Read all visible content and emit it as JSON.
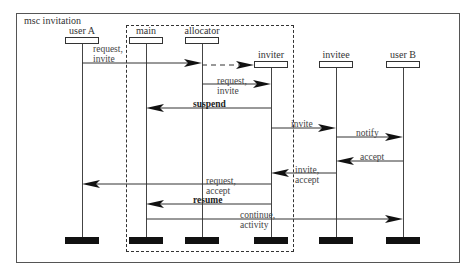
{
  "diagram": {
    "title": "msc invitation",
    "group_label": "",
    "instances": [
      {
        "id": "userA",
        "label": "user A",
        "x": 82,
        "head_y": 37
      },
      {
        "id": "main",
        "label": "main",
        "x": 146,
        "head_y": 37
      },
      {
        "id": "allocator",
        "label": "allocator",
        "x": 202,
        "head_y": 37
      },
      {
        "id": "inviter",
        "label": "inviter",
        "x": 271,
        "head_y": 61
      },
      {
        "id": "invitee",
        "label": "invitee",
        "x": 336,
        "head_y": 61
      },
      {
        "id": "userB",
        "label": "user B",
        "x": 403,
        "head_y": 61
      }
    ],
    "messages": [
      {
        "from": "userA",
        "to": "allocator",
        "y": 63,
        "label": "request,\ninvite",
        "style": "solid",
        "label_x": 93,
        "label_y": 44
      },
      {
        "from": "allocator",
        "to": "inviter",
        "y": 65,
        "label": "",
        "style": "dashed",
        "note": "create"
      },
      {
        "from": "allocator",
        "to": "inviter",
        "y": 84,
        "label": "request,\ninvite",
        "style": "solid",
        "label_x": 217,
        "label_y": 76
      },
      {
        "from": "inviter",
        "to": "main",
        "y": 108,
        "label": "suspend",
        "style": "solid",
        "bold": true,
        "label_x": 193,
        "label_y": 99
      },
      {
        "from": "inviter",
        "to": "invitee",
        "y": 128,
        "label": "invite",
        "style": "solid",
        "label_x": 291,
        "label_y": 119
      },
      {
        "from": "invitee",
        "to": "userB",
        "y": 137,
        "label": "notify",
        "style": "solid",
        "label_x": 356,
        "label_y": 128
      },
      {
        "from": "userB",
        "to": "invitee",
        "y": 161,
        "label": "accept",
        "style": "solid",
        "label_x": 360,
        "label_y": 152
      },
      {
        "from": "invitee",
        "to": "inviter",
        "y": 173,
        "label": "invite,\naccept",
        "style": "solid",
        "label_x": 295,
        "label_y": 165
      },
      {
        "from": "inviter",
        "to": "userA",
        "y": 184,
        "label": "request,\naccept",
        "style": "solid",
        "label_x": 206,
        "label_y": 176
      },
      {
        "from": "inviter",
        "to": "main",
        "y": 204,
        "label": "resume",
        "style": "solid",
        "bold": true,
        "label_x": 193,
        "label_y": 195
      },
      {
        "from": "main",
        "to": "userB",
        "y": 219,
        "label": "continue,\nactivity",
        "style": "solid",
        "label_x": 240,
        "label_y": 210
      }
    ]
  }
}
